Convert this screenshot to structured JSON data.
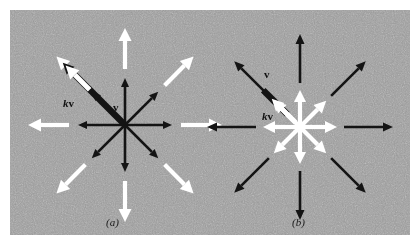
{
  "figure": {
    "width": 420,
    "height": 250,
    "background_color": "#ffffff",
    "panel_color": "#9a9a9a",
    "panel_texture": "gray-noise-halftone"
  },
  "colors": {
    "black_vector": "#141414",
    "white_vector": "#ffffff",
    "panel_gray": "#9a9a9a",
    "page_white": "#ffffff",
    "label_text": "#101010"
  },
  "panels": [
    {
      "id": "a",
      "caption": "(a)",
      "center": {
        "x": 125,
        "y": 125
      },
      "description": "scalar multiple k greater than one: kv longer than v",
      "star": {
        "ray_count": 8,
        "angles_deg": [
          0,
          45,
          90,
          135,
          180,
          225,
          270,
          315
        ],
        "inner_rays": {
          "color": "#141414",
          "radius": 47,
          "line_width": 2.6,
          "head_length": 9,
          "head_width": 8
        },
        "outer_rays": {
          "color": "#ffffff",
          "radius": 97,
          "line_width": 4.2,
          "head_length": 13,
          "head_width": 13,
          "start_radius": 56
        }
      },
      "highlight": {
        "direction_deg": 135,
        "thick_bar": {
          "color": "#141414",
          "radius": 88,
          "line_width": 6.5,
          "head_length": 11,
          "head_width": 11
        },
        "overlay_arrow": {
          "color": "#ffffff",
          "start_radius": 50,
          "radius": 84,
          "line_width": 5,
          "head_length": 13,
          "head_width": 13
        }
      },
      "labels": [
        {
          "name": "kv",
          "k": "k",
          "v": "v",
          "x": 63,
          "y": 97
        },
        {
          "name": "v",
          "k": "",
          "v": "v",
          "x": 113,
          "y": 101
        }
      ]
    },
    {
      "id": "b",
      "caption": "(b)",
      "center": {
        "x": 300,
        "y": 127
      },
      "description": "scalar multiple k between zero and one: kv shorter than v",
      "star": {
        "ray_count": 8,
        "angles_deg": [
          0,
          45,
          90,
          135,
          180,
          225,
          270,
          315
        ],
        "inner_rays": {
          "color": "#ffffff",
          "radius": 37,
          "line_width": 4.2,
          "head_length": 12,
          "head_width": 12
        },
        "outer_rays": {
          "color": "#141414",
          "radius": 93,
          "line_width": 2.6,
          "head_length": 10,
          "head_width": 9,
          "start_radius": 44
        }
      },
      "highlight": {
        "direction_deg": 135,
        "thick_bar": {
          "color": "#141414",
          "radius": 52,
          "start_radius": 18,
          "line_width": 6.5,
          "head_length": 0,
          "head_width": 0
        },
        "overlay_arrow": {
          "color": "#ffffff",
          "start_radius": 6,
          "radius": 40,
          "line_width": 5,
          "head_length": 12,
          "head_width": 12
        }
      },
      "labels": [
        {
          "name": "v",
          "k": "",
          "v": "v",
          "x": 264,
          "y": 68
        },
        {
          "name": "kv",
          "k": "k",
          "v": "v",
          "x": 262,
          "y": 110
        }
      ]
    }
  ]
}
